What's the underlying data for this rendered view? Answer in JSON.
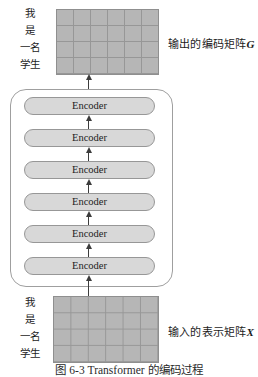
{
  "figure": {
    "caption": "图 6-3  Transformer 的编码过程",
    "top_words": [
      "我",
      "是",
      "一名",
      "学生"
    ],
    "bottom_words": [
      "我",
      "是",
      "一名",
      "学生"
    ],
    "output_label": "输出的编码矩阵",
    "output_var": "G",
    "input_label": "输入的表示矩阵",
    "input_var": "X",
    "encoders": [
      "Encoder",
      "Encoder",
      "Encoder",
      "Encoder",
      "Encoder",
      "Encoder"
    ],
    "matrix": {
      "rows": 4,
      "cols": 6
    },
    "colors": {
      "matrix_fill": "#b6b6b6",
      "matrix_grid": "#979797",
      "matrix_border": "#8f8f8f",
      "pill_fill": "#d8d8d8",
      "pill_border": "#979797",
      "frame_border": "#9f9f9f",
      "arrow": "#3c3c3c"
    }
  }
}
